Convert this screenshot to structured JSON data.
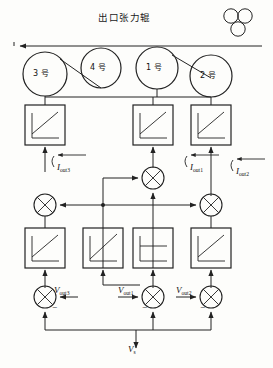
{
  "diagram": {
    "type": "control-block-diagram",
    "title": "出口张力辊",
    "title_meaning": "Exit tension roller",
    "stroke_color": "#222222",
    "background": "#fdfdfb",
    "web_arrow_direction": "left",
    "rollers": [
      {
        "id": "roller-3",
        "label": "3 号",
        "cx": 45,
        "cy": 74,
        "r": 22
      },
      {
        "id": "roller-4",
        "label": "4 号",
        "cx": 101,
        "cy": 68,
        "r": 20
      },
      {
        "id": "roller-1",
        "label": "1 号",
        "cx": 157,
        "cy": 68,
        "r": 21
      },
      {
        "id": "roller-2",
        "label": "2 号",
        "cx": 211,
        "cy": 76,
        "r": 21
      }
    ],
    "pinch_roll_cluster": {
      "id": "pinch-rolls",
      "count": 3,
      "cx": 238,
      "cy": 20
    },
    "current_labels": [
      {
        "id": "i-out3",
        "base": "I",
        "sub": "out3",
        "x": 57,
        "y": 163
      },
      {
        "id": "i-out1",
        "base": "I",
        "sub": "out1",
        "x": 190,
        "y": 163
      },
      {
        "id": "i-out2",
        "base": "I",
        "sub": "out2",
        "x": 236,
        "y": 167
      }
    ],
    "voltage_labels": [
      {
        "id": "v-out3",
        "base": "V",
        "sub": "out3",
        "x": 54,
        "y": 290
      },
      {
        "id": "v-out1",
        "base": "V",
        "sub": "out1",
        "x": 120,
        "y": 291
      },
      {
        "id": "v-out2",
        "base": "V",
        "sub": "out2",
        "x": 189,
        "y": 291
      }
    ],
    "source_label": {
      "id": "v-s",
      "base": "V",
      "sub": "s",
      "x": 128,
      "y": 350
    },
    "upper_blocks": [
      {
        "id": "block-upper-3",
        "x": 25,
        "y": 105,
        "w": 40,
        "h": 40,
        "curve": "ramp"
      },
      {
        "id": "block-upper-1",
        "x": 133,
        "y": 105,
        "w": 40,
        "h": 40,
        "curve": "ramp"
      },
      {
        "id": "block-upper-2",
        "x": 191,
        "y": 105,
        "w": 40,
        "h": 40,
        "curve": "ramp"
      }
    ],
    "lower_blocks": [
      {
        "id": "block-lower-3",
        "x": 25,
        "y": 228,
        "w": 40,
        "h": 40,
        "curve": "ramp"
      },
      {
        "id": "block-lower-1a",
        "x": 83,
        "y": 228,
        "w": 40,
        "h": 40,
        "curve": "ramp"
      },
      {
        "id": "block-lower-1b",
        "x": 133,
        "y": 228,
        "w": 40,
        "h": 40,
        "curve": "saturation"
      },
      {
        "id": "block-lower-2",
        "x": 191,
        "y": 228,
        "w": 40,
        "h": 40,
        "curve": "ramp"
      }
    ],
    "summing_junctions": [
      {
        "id": "sum-current-1",
        "cx": 153,
        "cy": 178,
        "r": 11
      },
      {
        "id": "sum-mid-3",
        "cx": 45,
        "cy": 205,
        "r": 11
      },
      {
        "id": "sum-mid-2",
        "cx": 211,
        "cy": 205,
        "r": 11
      },
      {
        "id": "sum-voltage-3",
        "cx": 45,
        "cy": 297,
        "r": 11
      },
      {
        "id": "sum-voltage-1",
        "cx": 153,
        "cy": 297,
        "r": 11
      },
      {
        "id": "sum-voltage-2",
        "cx": 211,
        "cy": 297,
        "r": 11
      }
    ],
    "minus_signs": [
      {
        "id": "minus-v3",
        "x": 52,
        "y": 306
      },
      {
        "id": "minus-v1",
        "x": 145,
        "y": 306
      },
      {
        "id": "minus-v2",
        "x": 203,
        "y": 306
      }
    ]
  }
}
